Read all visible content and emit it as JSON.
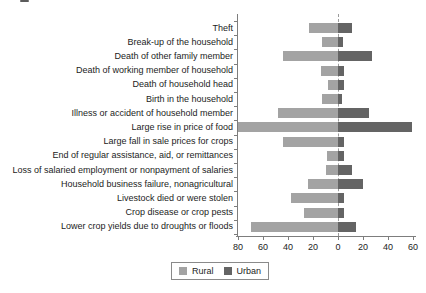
{
  "chart_data": {
    "type": "bar",
    "subtype": "diverging-horizontal",
    "title": "",
    "xlabel": "",
    "ylabel": "",
    "grid": false,
    "categories": [
      "Theft",
      "Break-up of the household",
      "Death of other family member",
      "Death of working member of household",
      "Death of household head",
      "Birth in the household",
      "Illness or accident of household member",
      "Large rise in price of food",
      "Large fall in sale prices for crops",
      "End of regular assistance, aid, or remittances",
      "Loss of salaried employment or nonpayment of salaries",
      "Household business failure, nonagricultural",
      "Livestock died or were stolen",
      "Crop disease or crop pests",
      "Lower crop yields due to droughts or floods"
    ],
    "series": [
      {
        "name": "Rural",
        "direction": "left",
        "color": "#a3a3a3",
        "values": [
          23,
          13,
          44,
          14,
          8,
          13,
          48,
          80,
          44,
          9,
          10,
          24,
          38,
          27,
          70
        ]
      },
      {
        "name": "Urban",
        "direction": "right",
        "color": "#646464",
        "values": [
          11,
          4,
          27,
          5,
          5,
          3,
          25,
          59,
          5,
          5,
          11,
          20,
          5,
          5,
          14
        ]
      }
    ],
    "x_axis": {
      "tick_labels": [
        "80",
        "60",
        "40",
        "20",
        "0",
        "20",
        "40",
        "60"
      ],
      "left_max": 80,
      "right_max": 60,
      "units_per_tick": 20
    },
    "legend": {
      "position": "bottom-center",
      "entries": [
        "Rural",
        "Urban"
      ]
    }
  }
}
